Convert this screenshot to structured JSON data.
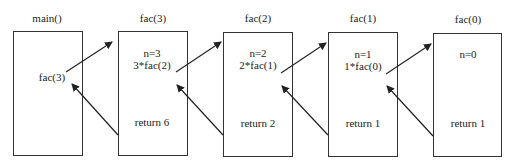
{
  "diagram": {
    "type": "recursion-call-stack",
    "frames": [
      {
        "title": "main()",
        "lines": [
          "fac(3)"
        ],
        "return_text": ""
      },
      {
        "title": "fac(3)",
        "lines": [
          "n=3",
          "3*fac(2)"
        ],
        "return_text": "return 6"
      },
      {
        "title": "fac(2)",
        "lines": [
          "n=2",
          "2*fac(1)"
        ],
        "return_text": "return 2"
      },
      {
        "title": "fac(1)",
        "lines": [
          "n=1",
          "1*fac(0)"
        ],
        "return_text": "return 1"
      },
      {
        "title": "fac(0)",
        "lines": [
          "n=0"
        ],
        "return_text": "return 1"
      }
    ],
    "arrows": [
      {
        "kind": "call",
        "from": "main()",
        "to": "fac(3)"
      },
      {
        "kind": "return",
        "from": "fac(3)",
        "to": "main()"
      },
      {
        "kind": "call",
        "from": "fac(3)",
        "to": "fac(2)"
      },
      {
        "kind": "return",
        "from": "fac(2)",
        "to": "fac(3)"
      },
      {
        "kind": "call",
        "from": "fac(2)",
        "to": "fac(1)"
      },
      {
        "kind": "return",
        "from": "fac(1)",
        "to": "fac(2)"
      },
      {
        "kind": "call",
        "from": "fac(1)",
        "to": "fac(0)"
      },
      {
        "kind": "return",
        "from": "fac(0)",
        "to": "fac(1)"
      }
    ],
    "colors": {
      "line": "#333333",
      "text": "#222222",
      "background": "#ffffff"
    }
  }
}
